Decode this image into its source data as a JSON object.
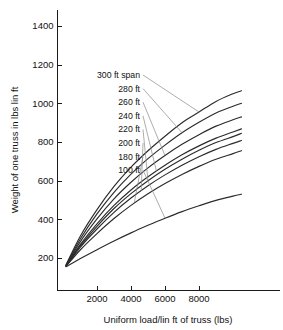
{
  "chart_data": {
    "type": "line",
    "title": "",
    "xlabel": "Uniform load/lin ft of truss (lbs)",
    "ylabel": "Weight of one truss in lbs lin ft",
    "xlim": [
      0,
      10500
    ],
    "ylim": [
      0,
      1500
    ],
    "xticks": [
      2000,
      4000,
      6000,
      8000
    ],
    "xtick_labels": [
      "2000",
      "4000",
      "6000",
      "8000"
    ],
    "yticks": [
      200,
      400,
      600,
      800,
      1000,
      1200,
      1400
    ],
    "ytick_labels": [
      "200",
      "400",
      "600",
      "800",
      "1000",
      "1200",
      "1400"
    ],
    "grid": false,
    "legend_position": "inside-upper-left-with-leader-lines",
    "x": [
      180,
      1000,
      2000,
      3000,
      4000,
      5000,
      6000,
      7000,
      8000,
      9000,
      10000,
      10500
    ],
    "series": [
      {
        "name": "300 ft span",
        "label": "300 ft span",
        "values": [
          165,
          310,
          450,
          570,
          670,
          755,
          830,
          900,
          955,
          1010,
          1050,
          1065
        ]
      },
      {
        "name": "280 ft",
        "label": "280 ft",
        "values": [
          163,
          296,
          428,
          540,
          634,
          714,
          784,
          848,
          902,
          950,
          985,
          1000
        ]
      },
      {
        "name": "260 ft",
        "label": "260 ft",
        "values": [
          161,
          282,
          402,
          506,
          592,
          666,
          730,
          788,
          838,
          882,
          915,
          930
        ]
      },
      {
        "name": "240 ft",
        "label": "240 ft",
        "values": [
          160,
          268,
          377,
          472,
          552,
          620,
          680,
          734,
          780,
          820,
          852,
          868
        ]
      },
      {
        "name": "220 ft",
        "label": "220 ft",
        "values": [
          159,
          261,
          364,
          456,
          533,
          600,
          659,
          711,
          757,
          797,
          828,
          845
        ]
      },
      {
        "name": "200 ft",
        "label": "200 ft",
        "values": [
          158,
          254,
          350,
          436,
          510,
          574,
          630,
          680,
          724,
          762,
          793,
          808
        ]
      },
      {
        "name": "180 ft",
        "label": "180 ft",
        "values": [
          157,
          240,
          326,
          404,
          472,
          532,
          585,
          632,
          674,
          711,
          740,
          755
        ]
      },
      {
        "name": "100 ft",
        "label": "100 ft",
        "values": [
          155,
          196,
          243,
          288,
          330,
          369,
          406,
          440,
          470,
          498,
          520,
          530
        ]
      }
    ],
    "annotations": [
      {
        "label": "300 ft span",
        "x": 8000,
        "y": 955
      },
      {
        "label": "280 ft",
        "x": 7000,
        "y": 848
      },
      {
        "label": "260 ft",
        "x": 6000,
        "y": 730
      },
      {
        "label": "240 ft",
        "x": 5500,
        "y": 648
      },
      {
        "label": "220 ft",
        "x": 5000,
        "y": 600
      },
      {
        "label": "200 ft",
        "x": 4600,
        "y": 546
      },
      {
        "label": "180 ft",
        "x": 4200,
        "y": 490
      },
      {
        "label": "100 ft",
        "x": 6000,
        "y": 406
      }
    ]
  },
  "colors": {
    "curve": "#2b2b2b",
    "axis": "#1a1a1a",
    "leader": "#8a8a8a",
    "background": "#ffffff"
  }
}
